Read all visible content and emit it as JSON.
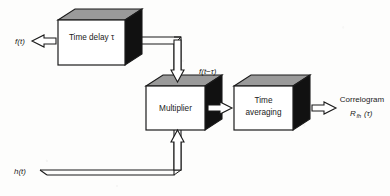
{
  "figure": {
    "type": "block-diagram",
    "background_color": "#fdfdfc",
    "stroke_color": "#1b1b1b",
    "box_front_color": "#ffffff",
    "box_top_color": "#9a9a9a",
    "box_side_color": "#111111"
  },
  "blocks": [
    {
      "id": "time-delay",
      "label": "Time delay τ",
      "lines": [
        "Time delay τ"
      ]
    },
    {
      "id": "multiplier",
      "label": "Multiplier",
      "lines": [
        "Multiplier"
      ]
    },
    {
      "id": "time-averaging",
      "label": "Time averaging",
      "lines": [
        "Time",
        "averaging"
      ]
    }
  ],
  "signals": {
    "input_f": "f(t)",
    "input_h": "h(t)",
    "delayed_f": "f(t−τ)",
    "output_name": "Correlogram",
    "output_symbol_main": "R",
    "output_symbol_sub": "fh",
    "output_symbol_arg": "(τ)"
  },
  "icons": {
    "input_arrow": "block-arrow-right-icon",
    "down_arrow": "block-arrow-down-icon",
    "up_arrow": "block-arrow-up-icon",
    "output_arrow": "block-arrow-right-icon"
  }
}
